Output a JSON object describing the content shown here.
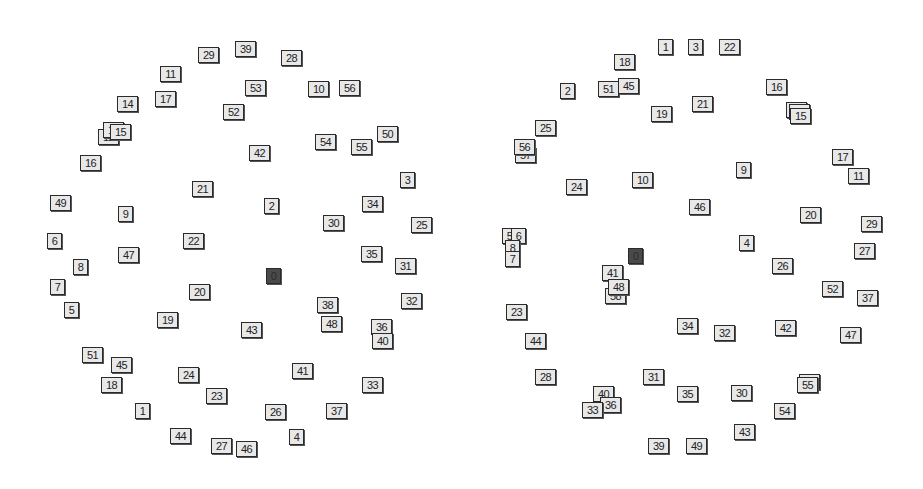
{
  "diagrams": [
    {
      "name": "left-layout",
      "root_label": "0",
      "colors": {
        "node_fill": "#e8e8e8",
        "node_border": "#2a2a2a",
        "root_fill": "#4a4a4a",
        "background": "#ffffff"
      },
      "nodes": [
        {
          "label": "29",
          "x": 198,
          "y": 47
        },
        {
          "label": "39",
          "x": 235,
          "y": 41
        },
        {
          "label": "28",
          "x": 281,
          "y": 50
        },
        {
          "label": "11",
          "x": 160,
          "y": 66
        },
        {
          "label": "53",
          "x": 245,
          "y": 80
        },
        {
          "label": "10",
          "x": 308,
          "y": 81
        },
        {
          "label": "56",
          "x": 339,
          "y": 80
        },
        {
          "label": "14",
          "x": 117,
          "y": 96
        },
        {
          "label": "17",
          "x": 155,
          "y": 91
        },
        {
          "label": "52",
          "x": 223,
          "y": 104
        },
        {
          "label": "12",
          "x": 98,
          "y": 129
        },
        {
          "label": "13",
          "x": 103,
          "y": 122
        },
        {
          "label": "15",
          "x": 110,
          "y": 124
        },
        {
          "label": "50",
          "x": 377,
          "y": 126
        },
        {
          "label": "54",
          "x": 315,
          "y": 134
        },
        {
          "label": "55",
          "x": 351,
          "y": 139
        },
        {
          "label": "42",
          "x": 249,
          "y": 145
        },
        {
          "label": "16",
          "x": 80,
          "y": 155
        },
        {
          "label": "3",
          "x": 400,
          "y": 172
        },
        {
          "label": "21",
          "x": 192,
          "y": 181
        },
        {
          "label": "49",
          "x": 50,
          "y": 195
        },
        {
          "label": "9",
          "x": 118,
          "y": 206
        },
        {
          "label": "2",
          "x": 264,
          "y": 198
        },
        {
          "label": "34",
          "x": 362,
          "y": 196
        },
        {
          "label": "30",
          "x": 323,
          "y": 215
        },
        {
          "label": "25",
          "x": 411,
          "y": 217
        },
        {
          "label": "6",
          "x": 47,
          "y": 233
        },
        {
          "label": "22",
          "x": 183,
          "y": 233
        },
        {
          "label": "47",
          "x": 118,
          "y": 247
        },
        {
          "label": "35",
          "x": 361,
          "y": 246
        },
        {
          "label": "8",
          "x": 73,
          "y": 259
        },
        {
          "label": "0",
          "x": 266,
          "y": 268,
          "root": true
        },
        {
          "label": "31",
          "x": 395,
          "y": 258
        },
        {
          "label": "7",
          "x": 50,
          "y": 279
        },
        {
          "label": "20",
          "x": 189,
          "y": 284
        },
        {
          "label": "32",
          "x": 401,
          "y": 293
        },
        {
          "label": "5",
          "x": 64,
          "y": 302
        },
        {
          "label": "19",
          "x": 157,
          "y": 312
        },
        {
          "label": "38",
          "x": 317,
          "y": 297
        },
        {
          "label": "43",
          "x": 241,
          "y": 322
        },
        {
          "label": "48",
          "x": 321,
          "y": 316
        },
        {
          "label": "36",
          "x": 371,
          "y": 319
        },
        {
          "label": "40",
          "x": 372,
          "y": 333
        },
        {
          "label": "51",
          "x": 82,
          "y": 347
        },
        {
          "label": "45",
          "x": 111,
          "y": 357
        },
        {
          "label": "24",
          "x": 178,
          "y": 367
        },
        {
          "label": "41",
          "x": 292,
          "y": 363
        },
        {
          "label": "18",
          "x": 101,
          "y": 377
        },
        {
          "label": "23",
          "x": 206,
          "y": 388
        },
        {
          "label": "33",
          "x": 362,
          "y": 377
        },
        {
          "label": "1",
          "x": 135,
          "y": 403
        },
        {
          "label": "26",
          "x": 265,
          "y": 404
        },
        {
          "label": "37",
          "x": 326,
          "y": 403
        },
        {
          "label": "44",
          "x": 170,
          "y": 428
        },
        {
          "label": "4",
          "x": 289,
          "y": 429
        },
        {
          "label": "27",
          "x": 211,
          "y": 438
        },
        {
          "label": "46",
          "x": 236,
          "y": 441
        }
      ]
    },
    {
      "name": "right-layout",
      "root_label": "0",
      "colors": {
        "node_fill": "#e8e8e8",
        "node_border": "#2a2a2a",
        "root_fill": "#4a4a4a",
        "background": "#ffffff"
      },
      "nodes": [
        {
          "label": "1",
          "x": 658,
          "y": 39
        },
        {
          "label": "3",
          "x": 688,
          "y": 39
        },
        {
          "label": "22",
          "x": 719,
          "y": 39
        },
        {
          "label": "18",
          "x": 614,
          "y": 54
        },
        {
          "label": "2",
          "x": 560,
          "y": 83
        },
        {
          "label": "51",
          "x": 598,
          "y": 81
        },
        {
          "label": "45",
          "x": 618,
          "y": 78
        },
        {
          "label": "16",
          "x": 766,
          "y": 79
        },
        {
          "label": "21",
          "x": 692,
          "y": 96
        },
        {
          "label": "19",
          "x": 651,
          "y": 106
        },
        {
          "label": "12",
          "x": 786,
          "y": 102
        },
        {
          "label": "13",
          "x": 789,
          "y": 104
        },
        {
          "label": "15",
          "x": 790,
          "y": 108
        },
        {
          "label": "25",
          "x": 535,
          "y": 120
        },
        {
          "label": "57",
          "x": 515,
          "y": 147
        },
        {
          "label": "56",
          "x": 514,
          "y": 139
        },
        {
          "label": "17",
          "x": 832,
          "y": 149
        },
        {
          "label": "9",
          "x": 736,
          "y": 162
        },
        {
          "label": "11",
          "x": 848,
          "y": 168
        },
        {
          "label": "10",
          "x": 632,
          "y": 172
        },
        {
          "label": "24",
          "x": 566,
          "y": 179
        },
        {
          "label": "46",
          "x": 689,
          "y": 199
        },
        {
          "label": "20",
          "x": 800,
          "y": 207
        },
        {
          "label": "29",
          "x": 861,
          "y": 216
        },
        {
          "label": "5",
          "x": 502,
          "y": 228
        },
        {
          "label": "6",
          "x": 511,
          "y": 228
        },
        {
          "label": "4",
          "x": 739,
          "y": 235
        },
        {
          "label": "8",
          "x": 505,
          "y": 240
        },
        {
          "label": "7",
          "x": 505,
          "y": 251
        },
        {
          "label": "27",
          "x": 854,
          "y": 243
        },
        {
          "label": "0",
          "x": 628,
          "y": 248,
          "root": true
        },
        {
          "label": "26",
          "x": 772,
          "y": 258
        },
        {
          "label": "41",
          "x": 602,
          "y": 265
        },
        {
          "label": "58",
          "x": 605,
          "y": 288
        },
        {
          "label": "48",
          "x": 608,
          "y": 279
        },
        {
          "label": "52",
          "x": 822,
          "y": 281
        },
        {
          "label": "37",
          "x": 857,
          "y": 290
        },
        {
          "label": "23",
          "x": 506,
          "y": 304
        },
        {
          "label": "34",
          "x": 677,
          "y": 318
        },
        {
          "label": "32",
          "x": 714,
          "y": 325
        },
        {
          "label": "42",
          "x": 775,
          "y": 320
        },
        {
          "label": "47",
          "x": 840,
          "y": 327
        },
        {
          "label": "44",
          "x": 525,
          "y": 333
        },
        {
          "label": "28",
          "x": 535,
          "y": 369
        },
        {
          "label": "31",
          "x": 643,
          "y": 369
        },
        {
          "label": "53",
          "x": 799,
          "y": 374
        },
        {
          "label": "55",
          "x": 797,
          "y": 377
        },
        {
          "label": "40",
          "x": 593,
          "y": 386
        },
        {
          "label": "35",
          "x": 677,
          "y": 386
        },
        {
          "label": "30",
          "x": 731,
          "y": 385
        },
        {
          "label": "36",
          "x": 600,
          "y": 397
        },
        {
          "label": "33",
          "x": 582,
          "y": 402
        },
        {
          "label": "54",
          "x": 774,
          "y": 403
        },
        {
          "label": "43",
          "x": 734,
          "y": 424
        },
        {
          "label": "39",
          "x": 648,
          "y": 438
        },
        {
          "label": "49",
          "x": 686,
          "y": 438
        }
      ]
    }
  ]
}
